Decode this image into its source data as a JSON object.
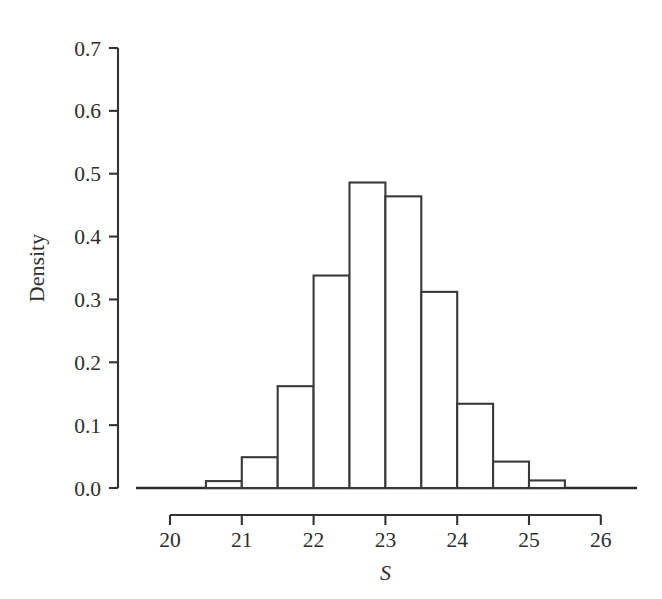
{
  "chart_data": {
    "type": "bar",
    "title": "",
    "subtitle": "",
    "xlabel": "S",
    "ylabel": "Density",
    "grid": false,
    "legend": false,
    "legend_position": "none",
    "xlim": [
      19.6,
      26.4
    ],
    "ylim": [
      0.0,
      0.7
    ],
    "bin_width": 0.5,
    "bin_edges": [
      20.5,
      21.0,
      21.5,
      22.0,
      22.5,
      23.0,
      23.5,
      24.0,
      24.5,
      25.0,
      25.5
    ],
    "categories": [
      "20.5-21.0",
      "21.0-21.5",
      "21.5-22.0",
      "22.0-22.5",
      "22.5-23.0",
      "23.0-23.5",
      "23.5-24.0",
      "24.0-24.5",
      "24.5-25.0",
      "25.0-25.5"
    ],
    "bin_centers": [
      20.75,
      21.25,
      21.75,
      22.25,
      22.75,
      23.25,
      23.75,
      24.25,
      24.75,
      25.25
    ],
    "values": [
      0.011,
      0.049,
      0.162,
      0.338,
      0.486,
      0.464,
      0.312,
      0.134,
      0.042,
      0.012
    ],
    "x_ticks": [
      20,
      21,
      22,
      23,
      24,
      25,
      26
    ],
    "x_tick_labels": [
      "20",
      "21",
      "22",
      "23",
      "24",
      "25",
      "26"
    ],
    "y_ticks": [
      0.0,
      0.1,
      0.2,
      0.3,
      0.4,
      0.5,
      0.6,
      0.7
    ],
    "y_tick_labels": [
      "0.0",
      "0.1",
      "0.2",
      "0.3",
      "0.4",
      "0.5",
      "0.6",
      "0.7"
    ],
    "colors": {
      "bar_fill": "#ffffff",
      "bar_stroke": "#3a3a3a",
      "axis": "#333333",
      "text": "#2e2e2e",
      "background": "#ffffff"
    }
  }
}
